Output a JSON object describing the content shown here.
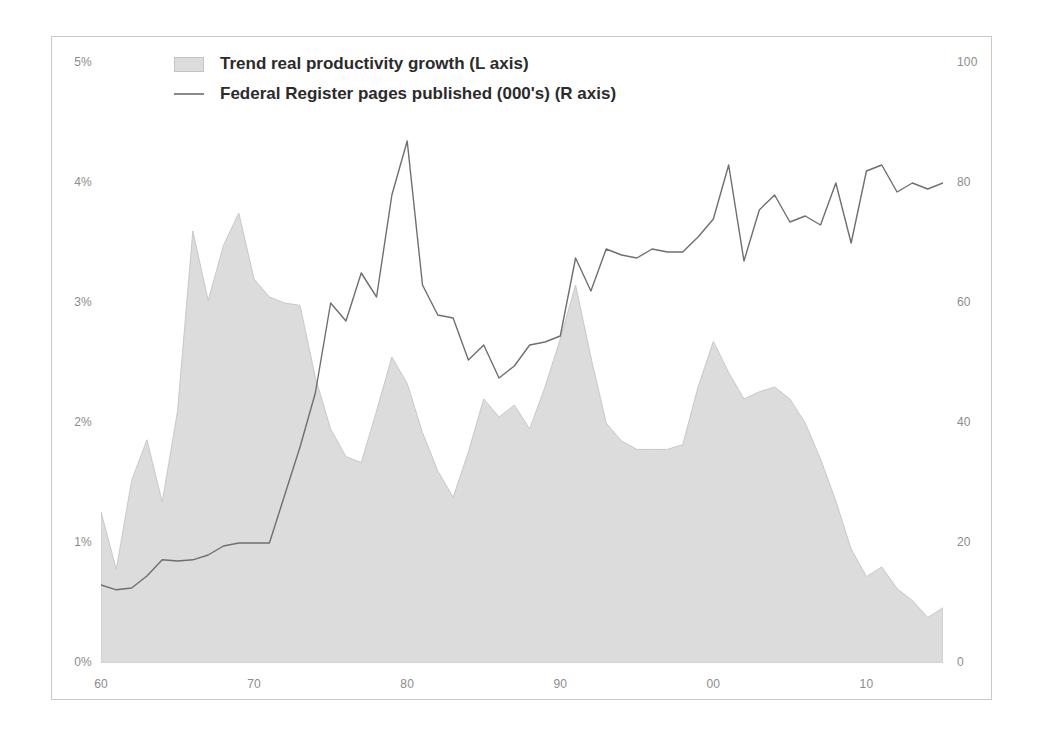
{
  "chart_data": {
    "type": "area",
    "title": "",
    "xlabel": "",
    "ylabel": "",
    "grid": false,
    "legend_position": "top-left",
    "x": [
      1960,
      1961,
      1962,
      1963,
      1964,
      1965,
      1966,
      1967,
      1968,
      1969,
      1970,
      1971,
      1972,
      1973,
      1974,
      1975,
      1976,
      1977,
      1978,
      1979,
      1980,
      1981,
      1982,
      1983,
      1984,
      1985,
      1986,
      1987,
      1988,
      1989,
      1990,
      1991,
      1992,
      1993,
      1994,
      1995,
      1996,
      1997,
      1998,
      1999,
      2000,
      2001,
      2002,
      2003,
      2004,
      2005,
      2006,
      2007,
      2008,
      2009,
      2010,
      2011,
      2012,
      2013,
      2014,
      2015
    ],
    "x_tick_labels": [
      "60",
      "70",
      "80",
      "90",
      "00",
      "10"
    ],
    "x_tick_values": [
      1960,
      1970,
      1980,
      1990,
      2000,
      2010
    ],
    "axes": [
      {
        "side": "left",
        "label": "Trend real productivity growth",
        "tick_labels": [
          "0%",
          "1%",
          "2%",
          "3%",
          "4%",
          "5%"
        ],
        "tick_values": [
          0,
          1,
          2,
          3,
          4,
          5
        ],
        "lim": [
          0,
          5
        ],
        "unit": "%"
      },
      {
        "side": "right",
        "label": "Federal Register pages published (000's)",
        "tick_labels": [
          "0",
          "20",
          "40",
          "60",
          "80",
          "100"
        ],
        "tick_values": [
          0,
          20,
          40,
          60,
          80,
          100
        ],
        "lim": [
          0,
          100
        ],
        "unit": "thousand pages"
      }
    ],
    "series": [
      {
        "name": "Trend real productivity growth (L axis)",
        "render": "area",
        "axis": "left",
        "color": "#dcdcdc",
        "stroke": "#c8c8c8",
        "values": [
          1.26,
          0.78,
          1.52,
          1.86,
          1.34,
          2.1,
          3.6,
          3.02,
          3.48,
          3.75,
          3.2,
          3.05,
          3.0,
          2.98,
          2.38,
          1.95,
          1.72,
          1.67,
          2.1,
          2.55,
          2.33,
          1.92,
          1.6,
          1.38,
          1.76,
          2.2,
          2.05,
          2.15,
          1.95,
          2.3,
          2.7,
          3.15,
          2.55,
          2.0,
          1.85,
          1.78,
          1.78,
          1.78,
          1.82,
          2.3,
          2.68,
          2.42,
          2.2,
          2.26,
          2.3,
          2.2,
          2.0,
          1.7,
          1.35,
          0.95,
          0.72,
          0.8,
          0.62,
          0.52,
          0.38,
          0.46
        ]
      },
      {
        "name": "Federal Register pages published (000's) (R axis)",
        "render": "line",
        "axis": "right",
        "color": "#6f6f6f",
        "values": [
          13,
          12.2,
          12.5,
          14.5,
          17.2,
          17.0,
          17.2,
          18.0,
          19.5,
          20.0,
          20.0,
          20.0,
          28.0,
          36.0,
          45.0,
          60.0,
          57.0,
          65.0,
          61.0,
          78.0,
          87.0,
          63.0,
          58.0,
          57.5,
          50.5,
          53.0,
          47.5,
          49.5,
          53.0,
          53.5,
          54.5,
          67.5,
          62.0,
          69.0,
          68.0,
          67.5,
          69.0,
          68.5,
          68.5,
          71.0,
          74.0,
          83.0,
          67.0,
          75.5,
          78.0,
          73.5,
          74.5,
          73.0,
          80.0,
          70.0,
          82.0,
          83.0,
          78.5,
          80.0,
          79.0,
          80.0
        ]
      }
    ]
  },
  "legend": {
    "items": [
      {
        "marker": "area-swatch",
        "label": "Trend real productivity growth (L axis)"
      },
      {
        "marker": "line-swatch",
        "label": "Federal Register pages published (000's) (R axis)"
      }
    ]
  },
  "axis_left": {
    "ticks": [
      {
        "label": "5%",
        "value": 5
      },
      {
        "label": "4%",
        "value": 4
      },
      {
        "label": "3%",
        "value": 3
      },
      {
        "label": "2%",
        "value": 2
      },
      {
        "label": "1%",
        "value": 1
      },
      {
        "label": "0%",
        "value": 0
      }
    ]
  },
  "axis_right": {
    "ticks": [
      {
        "label": "100",
        "value": 100
      },
      {
        "label": "80",
        "value": 80
      },
      {
        "label": "60",
        "value": 60
      },
      {
        "label": "40",
        "value": 40
      },
      {
        "label": "20",
        "value": 20
      },
      {
        "label": "0",
        "value": 0
      }
    ]
  },
  "axis_x": {
    "ticks": [
      {
        "label": "60",
        "value": 1960
      },
      {
        "label": "70",
        "value": 1970
      },
      {
        "label": "80",
        "value": 1980
      },
      {
        "label": "90",
        "value": 1990
      },
      {
        "label": "00",
        "value": 2000
      },
      {
        "label": "10",
        "value": 2010
      }
    ]
  },
  "colors": {
    "area_fill": "#dcdcdc",
    "area_stroke": "#c8c8c8",
    "line": "#6f6f6f",
    "frame_border": "#c9c9c9",
    "tick_text": "#8c8c8c",
    "legend_text": "#2b2b2b",
    "background": "#ffffff"
  }
}
